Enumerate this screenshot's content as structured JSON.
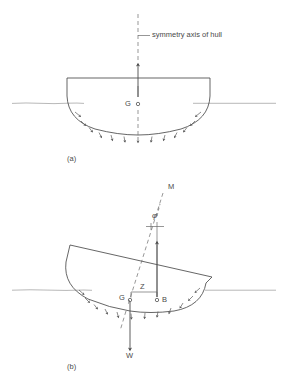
{
  "figure": {
    "type": "ship-hull-hydrostatic-stability-diagram",
    "panels": [
      {
        "id": "a",
        "caption": "(a)",
        "state": "upright",
        "labels": [
          {
            "name": "symmetry-axis-label",
            "text": "symmetry axis of hull",
            "x": 152,
            "y": 35
          },
          {
            "name": "center-of-gravity-label",
            "text": "G",
            "x": 125,
            "y": 104
          }
        ]
      },
      {
        "id": "b",
        "caption": "(b)",
        "state": "heeled",
        "labels": [
          {
            "name": "metacenter-label",
            "text": "M",
            "x": 168,
            "y": 186
          },
          {
            "name": "heel-angle-label",
            "text": "φ",
            "x": 152,
            "y": 215
          },
          {
            "name": "center-of-gravity-label",
            "text": "G",
            "x": 120,
            "y": 296
          },
          {
            "name": "righting-arm-label",
            "text": "Z",
            "x": 140,
            "y": 289
          },
          {
            "name": "center-of-buoyancy-label",
            "text": "B",
            "x": 162,
            "y": 298
          },
          {
            "name": "weight-label",
            "text": "W",
            "x": 131,
            "y": 354
          }
        ]
      }
    ],
    "colors": {
      "line": "#555555",
      "hull": "#4a4a4a",
      "waterline": "#8a8a8a",
      "pressure": "#5a5a5a",
      "text": "#4a4a4a",
      "background": "#ffffff"
    },
    "geometry": {
      "panel_a": {
        "deck_y": 78,
        "deck_left_x": 67,
        "deck_right_x": 210,
        "waterline_y": 103,
        "hull_bottom_y": 133,
        "axis_x": 138,
        "g_point": [
          138,
          104
        ],
        "buoyancy_arrow_tip_y": 62
      },
      "panel_b": {
        "waterline_y": 290,
        "heel_degrees": 13,
        "deck_left": [
          70,
          245
        ],
        "deck_right": [
          212,
          277
        ],
        "g_point": [
          130,
          300
        ],
        "b_point": [
          157,
          300
        ],
        "m_point": [
          163,
          193
        ],
        "weight_arrow_tip": [
          135,
          348
        ]
      }
    }
  }
}
